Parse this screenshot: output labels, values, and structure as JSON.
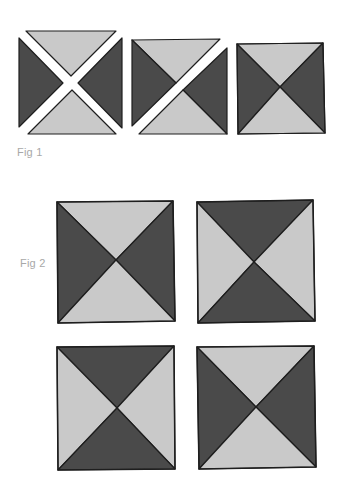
{
  "figures": [
    {
      "label": "Fig 1",
      "description": "Assembly sequence of a quarter-square triangle (hourglass) block: four separate triangles, two halves joined, completed square",
      "blocks": [
        {
          "stage": "four-triangles",
          "top": "light",
          "left": "dark",
          "right": "dark",
          "bottom": "light"
        },
        {
          "stage": "two-halves",
          "top": "light",
          "left": "dark",
          "right": "dark",
          "bottom": "light"
        },
        {
          "stage": "complete",
          "top": "light",
          "left": "dark",
          "right": "dark",
          "bottom": "light"
        }
      ]
    },
    {
      "label": "Fig 2",
      "description": "Four completed quarter-square triangle blocks arranged in a 2x2 grid with alternating orientation",
      "blocks": [
        {
          "position": "top-left",
          "top": "light",
          "left": "dark",
          "right": "dark",
          "bottom": "light"
        },
        {
          "position": "top-right",
          "top": "dark",
          "left": "light",
          "right": "light",
          "bottom": "dark"
        },
        {
          "position": "bottom-left",
          "top": "dark",
          "left": "light",
          "right": "light",
          "bottom": "dark"
        },
        {
          "position": "bottom-right",
          "top": "light",
          "left": "dark",
          "right": "dark",
          "bottom": "light"
        }
      ]
    }
  ],
  "colors": {
    "dark": "#4a4a4a",
    "light": "#c9c9c9",
    "outline": "#1e1e1e",
    "label": "#a8a8a8",
    "background": "#ffffff"
  }
}
